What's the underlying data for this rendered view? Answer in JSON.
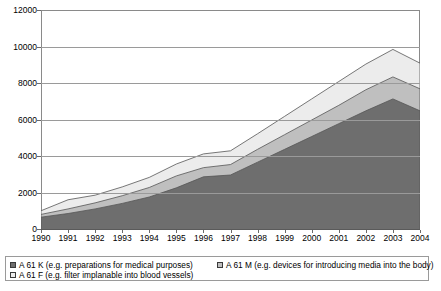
{
  "chart_data": {
    "type": "area",
    "stacked": true,
    "title": "",
    "subtitle": "",
    "xlabel": "",
    "ylabel": "",
    "categories": [
      "1990",
      "1991",
      "1992",
      "1993",
      "1994",
      "1995",
      "1996",
      "1997",
      "1998",
      "1999",
      "2000",
      "2001",
      "2002",
      "2003",
      "2004"
    ],
    "x_tick_labels": [
      "1990",
      "1991",
      "1992",
      "1993",
      "1994",
      "1995",
      "1996",
      "1997",
      "1998",
      "1999",
      "2000",
      "2001",
      "2002",
      "2003",
      "2004"
    ],
    "y_tick_labels": [
      "0",
      "2000",
      "4000",
      "6000",
      "8000",
      "10000",
      "12000"
    ],
    "y_ticks": [
      0,
      2000,
      4000,
      6000,
      8000,
      10000,
      12000
    ],
    "ylim": [
      0,
      12000
    ],
    "xlim": [
      "1990",
      "2004"
    ],
    "grid": true,
    "legend_position": "bottom",
    "series": [
      {
        "name": "A 61 K (e.g. preparations for medical purposes)",
        "short_name": "A 61 K",
        "color": "#6e6e6e",
        "values": [
          700,
          900,
          1150,
          1450,
          1800,
          2300,
          2900,
          3000,
          3700,
          4400,
          5100,
          5800,
          6500,
          7150,
          6500
        ]
      },
      {
        "name": "A 61 M (e.g. devices for introducing media into the body)",
        "short_name": "A 61 M",
        "color": "#bfbfbf",
        "values": [
          150,
          250,
          330,
          420,
          520,
          650,
          500,
          570,
          700,
          800,
          900,
          1000,
          1150,
          1200,
          1200
        ]
      },
      {
        "name": "A 61 F (e.g. filter implanable into blood vessels)",
        "short_name": "A 61 F",
        "color": "#ececec",
        "values": [
          200,
          500,
          420,
          480,
          550,
          650,
          750,
          750,
          850,
          1000,
          1150,
          1300,
          1400,
          1500,
          1400
        ]
      }
    ],
    "stacked_totals": [
      1050,
      1650,
      1900,
      2350,
      2870,
      3600,
      4150,
      4320,
      5250,
      6200,
      7150,
      8100,
      9050,
      9850,
      9100
    ]
  },
  "legend": {
    "entries": [
      {
        "label": "A 61 K (e.g. preparations for medical purposes)",
        "swatch_color": "#6e6e6e"
      },
      {
        "label": "A 61 F (e.g. filter implanable into blood vessels)",
        "swatch_color": "#ececec"
      },
      {
        "label": "A 61 M (e.g. devices for introducing media into the body)",
        "swatch_color": "#bfbfbf"
      }
    ]
  },
  "colors": {
    "series_k": "#6e6e6e",
    "series_m": "#bfbfbf",
    "series_f": "#ececec",
    "gridline": "#9a9a9a",
    "axis": "#8a8a8a",
    "background": "#ffffff",
    "text": "#000000"
  }
}
